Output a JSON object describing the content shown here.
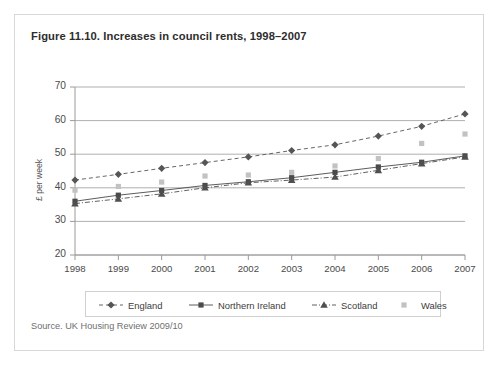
{
  "figure": {
    "title": "Figure 11.10. Increases in council rents, 1998–2007",
    "source": "Source. UK Housing Review 2009/10"
  },
  "legend": {
    "items": [
      {
        "label": "England",
        "color": "#555555",
        "marker": "diamond",
        "dash": "4,3"
      },
      {
        "label": "Northern Ireland",
        "color": "#4a4a4a",
        "marker": "square",
        "dash": "none"
      },
      {
        "label": "Scotland",
        "color": "#4f4f4f",
        "marker": "triangle",
        "dash": "5,2,1,2"
      },
      {
        "label": "Wales",
        "color": "#c2c2c2",
        "marker": "square",
        "dash": "dotted-none"
      }
    ]
  },
  "chart_data": {
    "type": "line",
    "title": "Figure 11.10. Increases in council rents, 1998–2007",
    "xlabel": "",
    "ylabel": "£ per week",
    "categories": [
      "1998",
      "1999",
      "2000",
      "2001",
      "2002",
      "2003",
      "2004",
      "2005",
      "2006",
      "2007"
    ],
    "x": [
      1998,
      1999,
      2000,
      2001,
      2002,
      2003,
      2004,
      2005,
      2006,
      2007
    ],
    "ylim": [
      20,
      70
    ],
    "yticks": [
      20,
      30,
      40,
      50,
      60,
      70
    ],
    "grid": true,
    "legend_position": "bottom",
    "series": [
      {
        "name": "England",
        "color": "#555555",
        "marker": "diamond",
        "linestyle": "dashed",
        "values": [
          42.3,
          44.0,
          45.8,
          47.5,
          49.2,
          51.1,
          52.8,
          55.4,
          58.3,
          62.0
        ]
      },
      {
        "name": "Northern Ireland",
        "color": "#4a4a4a",
        "marker": "square",
        "linestyle": "solid",
        "values": [
          36.0,
          37.8,
          39.2,
          40.7,
          41.8,
          43.0,
          44.6,
          46.2,
          47.6,
          49.5
        ]
      },
      {
        "name": "Scotland",
        "color": "#4f4f4f",
        "marker": "triangle",
        "linestyle": "dashdot",
        "values": [
          35.3,
          36.7,
          38.2,
          40.0,
          41.5,
          42.3,
          43.2,
          45.2,
          47.2,
          49.2
        ]
      },
      {
        "name": "Wales",
        "color": "#c2c2c2",
        "marker": "square",
        "linestyle": "none",
        "values": [
          39.3,
          40.4,
          41.7,
          43.5,
          43.8,
          44.6,
          46.5,
          48.7,
          53.2,
          56.0
        ]
      }
    ]
  }
}
